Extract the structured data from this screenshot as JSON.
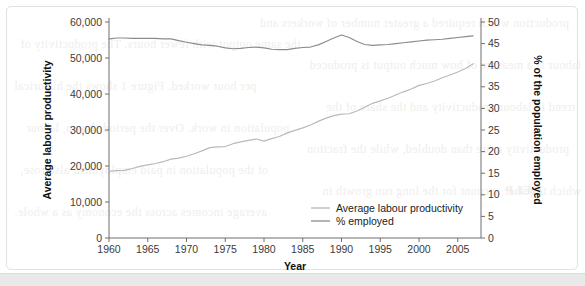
{
  "figure": {
    "background_color": "#ffffff",
    "frame_color": "#e2e2e2",
    "page_band_color": "#e9e9e9"
  },
  "ghost_text": [
    "production which required a greater number of workers and",
    "the same output with fewer hours. The productivity of",
    "labour is a measure of how much output is produced",
    "per hour worked. Figure 1 shows the historical",
    "trend in labour productivity and the share of the",
    "population in work. Over the period shown, labour",
    "productivity more than doubled, while the fraction",
    "of the population in paid employment also rose,",
    "which together account for the long run growth in",
    "average incomes across the economy as a whole.",
    "HELP"
  ],
  "chart_data": {
    "type": "line",
    "title": "",
    "xlabel": "Year",
    "ylabel": "Average labour productivity",
    "y2label": "% of the population employed",
    "grid": false,
    "legend_position": "inside-bottom-right",
    "xlim": [
      1960,
      2008
    ],
    "xticks": [
      1960,
      1965,
      1970,
      1975,
      1980,
      1985,
      1990,
      1995,
      2000,
      2005
    ],
    "xtick_labels": [
      "1960",
      "1965",
      "1970",
      "1975",
      "1980",
      "1985",
      "1990",
      "1995",
      "2000",
      "2005"
    ],
    "ylim": [
      0,
      60000
    ],
    "yticks": [
      0,
      10000,
      20000,
      30000,
      40000,
      50000,
      60000
    ],
    "ytick_labels": [
      "0",
      "10,000",
      "20,000",
      "30,000",
      "40,000",
      "50,000",
      "60,000"
    ],
    "y2lim": [
      0,
      50
    ],
    "y2ticks": [
      0,
      5,
      10,
      15,
      20,
      25,
      30,
      35,
      40,
      45,
      50
    ],
    "y2tick_labels": [
      "0",
      "5",
      "10",
      "15",
      "20",
      "25",
      "30",
      "35",
      "40",
      "45",
      "50"
    ],
    "x": [
      1960,
      1961,
      1962,
      1963,
      1964,
      1965,
      1966,
      1967,
      1968,
      1969,
      1970,
      1971,
      1972,
      1973,
      1974,
      1975,
      1976,
      1977,
      1978,
      1979,
      1980,
      1981,
      1982,
      1983,
      1984,
      1985,
      1986,
      1987,
      1988,
      1989,
      1990,
      1991,
      1992,
      1993,
      1994,
      1995,
      1996,
      1997,
      1998,
      1999,
      2000,
      2001,
      2002,
      2003,
      2004,
      2005,
      2006,
      2007
    ],
    "series": [
      {
        "name": "Average labour productivity",
        "axis": "left",
        "color": "#b9b9b9",
        "units": "output per worker",
        "values": [
          18500,
          18700,
          18800,
          19300,
          19900,
          20300,
          20700,
          21200,
          21900,
          22200,
          22700,
          23400,
          24200,
          25100,
          25300,
          25400,
          26200,
          26700,
          27100,
          27500,
          26900,
          27600,
          28200,
          29200,
          29900,
          30600,
          31400,
          32400,
          33300,
          34000,
          34400,
          34500,
          35300,
          36300,
          37400,
          38100,
          38800,
          39700,
          40600,
          41400,
          42400,
          42900,
          43600,
          44500,
          45300,
          46100,
          47100,
          48400
        ]
      },
      {
        "name": "% employed",
        "axis": "right",
        "color": "#8c8c8c",
        "units": "% of the population employed",
        "values": [
          46.1,
          46.3,
          46.3,
          46.2,
          46.2,
          46.2,
          46.2,
          46.1,
          46.1,
          45.7,
          45.3,
          45.0,
          44.7,
          44.6,
          44.4,
          44.0,
          43.8,
          43.9,
          44.1,
          44.2,
          44.0,
          43.7,
          43.6,
          43.6,
          43.9,
          44.1,
          44.2,
          44.7,
          45.5,
          46.3,
          47.0,
          46.4,
          45.5,
          44.8,
          44.6,
          44.7,
          44.8,
          45.0,
          45.2,
          45.4,
          45.6,
          45.8,
          45.9,
          46.0,
          46.2,
          46.4,
          46.6,
          46.8
        ]
      }
    ],
    "legend": [
      {
        "label": "Average labour productivity",
        "color": "#b9b9b9"
      },
      {
        "label": "% employed",
        "color": "#8c8c8c"
      }
    ]
  }
}
